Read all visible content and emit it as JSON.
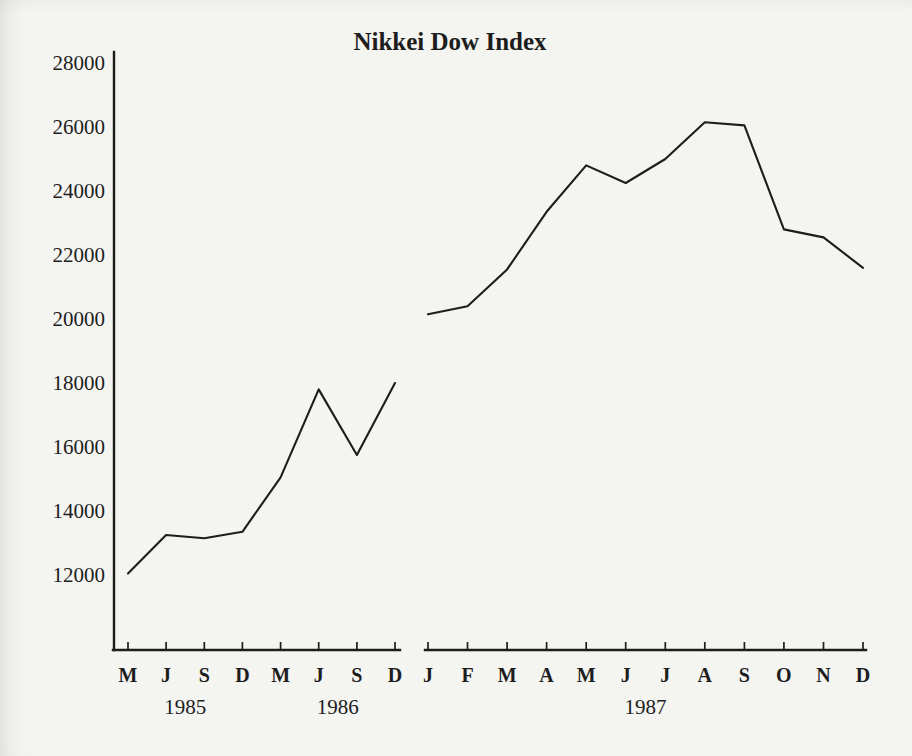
{
  "page": {
    "background": "#f4f4f1",
    "ink": "#1d1d1d"
  },
  "chart_data": {
    "type": "line",
    "title": "Nikkei Dow Index",
    "xlabel": "",
    "ylabel": "",
    "ylim": [
      9650,
      28350
    ],
    "yticks": [
      12000,
      14000,
      16000,
      18000,
      20000,
      22000,
      24000,
      26000,
      28000
    ],
    "grid": false,
    "legend_position": "none",
    "line_color": "#1d1d1d",
    "axis_note": "broken x-axis: two separate baselines with a gap, single unlabeled y-axis at left",
    "segments": [
      {
        "label": "1985-1986 quarterly (Mar Jun Sep Dec)",
        "x_tick_labels": [
          "M",
          "J",
          "S",
          "D",
          "M",
          "J",
          "S",
          "D"
        ],
        "years": [
          {
            "label": "1985",
            "tick_span": [
              0,
              3
            ]
          },
          {
            "label": "1986",
            "tick_span": [
              4,
              7
            ]
          }
        ],
        "values": [
          12050,
          13250,
          13150,
          13350,
          15050,
          17800,
          15750,
          18000
        ]
      },
      {
        "label": "1987 monthly",
        "x_tick_labels": [
          "J",
          "F",
          "M",
          "A",
          "M",
          "J",
          "J",
          "A",
          "S",
          "O",
          "N",
          "D"
        ],
        "years": [
          {
            "label": "1987",
            "tick_span": [
              0,
              11
            ]
          }
        ],
        "values": [
          20150,
          20400,
          21550,
          23350,
          24800,
          24250,
          25000,
          26150,
          26050,
          22800,
          22550,
          21600
        ]
      }
    ]
  }
}
